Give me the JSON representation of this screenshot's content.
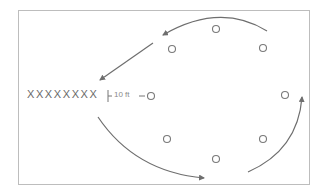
{
  "diagram": {
    "players_line": "XXXXXXXX",
    "distance_label": "10 ft",
    "stroke_color": "#6e6e6e",
    "cone_color": "#7a7a7a",
    "border_color": "#bdbdbd",
    "cones": [
      {
        "x": 216,
        "y": 29
      },
      {
        "x": 172,
        "y": 49
      },
      {
        "x": 263,
        "y": 48
      },
      {
        "x": 285,
        "y": 95
      },
      {
        "x": 167,
        "y": 139
      },
      {
        "x": 263,
        "y": 139
      },
      {
        "x": 216,
        "y": 159
      },
      {
        "x": 151,
        "y": 96
      }
    ]
  }
}
